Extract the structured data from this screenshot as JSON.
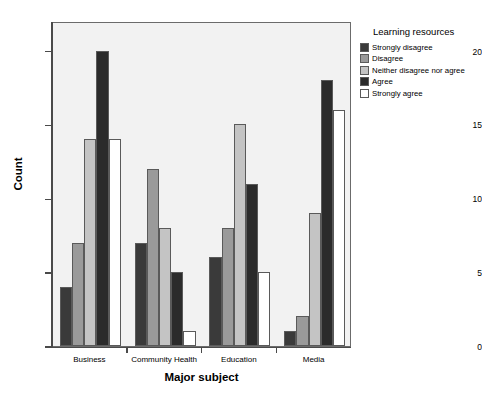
{
  "chart_data": {
    "type": "bar",
    "title": "",
    "xlabel": "Major subject",
    "ylabel": "Count",
    "ylim": [
      0,
      22
    ],
    "y_ticks": [
      0,
      5,
      10,
      15,
      20
    ],
    "y_tick_labels": [
      "0",
      "5",
      "10",
      "15",
      "20"
    ],
    "grid": false,
    "categories": [
      "Business",
      "Community Health",
      "Education",
      "Media"
    ],
    "legend_title": "Learning resources",
    "legend_position": "right",
    "series": [
      {
        "name": "Strongly disagree",
        "color": "#3a3a3a",
        "values": [
          4,
          7,
          6,
          1
        ]
      },
      {
        "name": "Disagree",
        "color": "#9a9a9a",
        "values": [
          7,
          12,
          8,
          2
        ]
      },
      {
        "name": "Neither disagree nor agree",
        "color": "#c4c4c4",
        "values": [
          14,
          8,
          15,
          9
        ]
      },
      {
        "name": "Agree",
        "color": "#2b2b2b",
        "values": [
          20,
          5,
          11,
          18
        ]
      },
      {
        "name": "Strongly agree",
        "color": "#ffffff",
        "values": [
          14,
          1,
          5,
          16
        ]
      }
    ]
  },
  "axes": {
    "y_title": "Count",
    "x_title": "Major subject"
  },
  "legend": {
    "title": "Learning resources"
  }
}
